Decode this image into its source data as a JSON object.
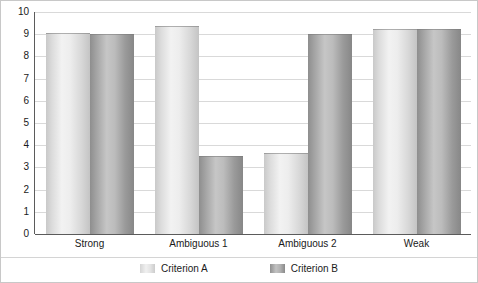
{
  "chart_data": {
    "type": "bar",
    "title": "",
    "subtitle": "",
    "xlabel": "",
    "ylabel": "",
    "ylim": [
      0,
      10
    ],
    "ytick_step": 1,
    "yticks": [
      10,
      9,
      8,
      7,
      6,
      5,
      4,
      3,
      2,
      1,
      0
    ],
    "grid": true,
    "legend_position": "bottom-center",
    "categories": [
      "Strong",
      "Ambiguous 1",
      "Ambiguous 2",
      "Weak"
    ],
    "series": [
      {
        "name": "Criterion A",
        "color": "#e6e6e6",
        "values": [
          9.05,
          9.35,
          3.65,
          9.25
        ]
      },
      {
        "name": "Criterion B",
        "color": "#a8a8a8",
        "values": [
          9.0,
          3.5,
          9.0,
          9.25
        ]
      }
    ]
  },
  "legend": {
    "items": [
      {
        "label": "Criterion A",
        "swatch": "series-a-swatch-icon"
      },
      {
        "label": "Criterion B",
        "swatch": "series-b-swatch-icon"
      }
    ]
  },
  "colors": {
    "axis": "#5b5b5b",
    "grid": "#d9d9d9",
    "frame": "#c8c8c8",
    "text": "#1a1a1a",
    "series_a": "#e6e6e6",
    "series_b": "#a8a8a8"
  }
}
